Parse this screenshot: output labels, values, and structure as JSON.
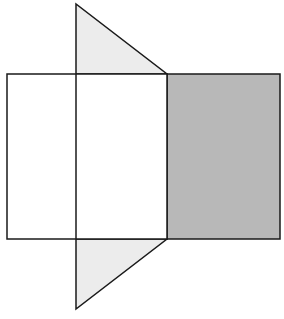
{
  "diagram": {
    "colors": {
      "stroke": "#1a1a1a",
      "shaded_face": "#b8b8b8",
      "triangle_face": "#ececec",
      "background": "#ffffff"
    },
    "shapes": {
      "left_rect": {
        "x": 7,
        "y": 74,
        "w": 160,
        "h": 165
      },
      "right_rect": {
        "x": 167,
        "y": 74,
        "w": 113,
        "h": 165
      },
      "fold_line_x": 76,
      "top_triangle": [
        [
          76,
          4
        ],
        [
          76,
          74
        ],
        [
          167,
          74
        ]
      ],
      "bottom_triangle": [
        [
          76,
          239
        ],
        [
          167,
          239
        ],
        [
          76,
          309
        ]
      ]
    }
  }
}
